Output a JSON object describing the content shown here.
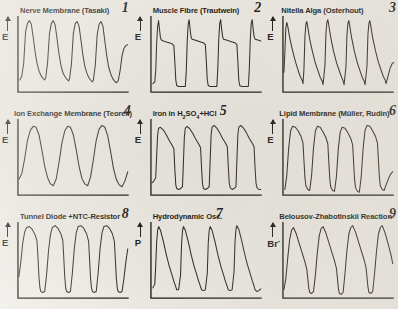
{
  "figure": {
    "background_color": "#f1eee8",
    "ink_color": "#15130f",
    "rows": 3,
    "columns": 3
  },
  "panels": [
    {
      "number": "1",
      "title": "Nerve Membrane (Tasaki)",
      "y_axis_label": "E",
      "waveform": "spike-train-fast-rise-slow-decay"
    },
    {
      "number": "2",
      "title": "Muscle Fibre (Trautwein)",
      "y_axis_label": "E",
      "waveform": "plateau-action-potential"
    },
    {
      "number": "3",
      "title": "Nitella Alga (Osterhout)",
      "y_axis_label": "E",
      "waveform": "spike-train-sawtooth-decay"
    },
    {
      "number": "4",
      "title": "Ion Exchange Membrane (Teorell)",
      "y_axis_label": "E",
      "waveform": "smooth-rounded-sinusoidal"
    },
    {
      "number": "5",
      "title_prefix": "Iron in H",
      "title_sub1": "2",
      "title_mid": "SO",
      "title_sub2": "4",
      "title_suffix": "+HCl",
      "title": "Iron in H2SO4+HCl",
      "y_axis_label": "E",
      "waveform": "square-relaxation-slow-decay"
    },
    {
      "number": "6",
      "title": "Lipid Membrane (Müller, Rudin)",
      "y_axis_label": "E",
      "waveform": "sharp-rise-concave-decay"
    },
    {
      "number": "8",
      "title": "Tunnel Diode +NTC-Resistor",
      "y_axis_label": "E",
      "waveform": "relaxation-slow-rise-vertical-drop"
    },
    {
      "number": "7",
      "title": "Hydrodynamic Osc.",
      "y_axis_label": "P",
      "waveform": "spike-train-fast-rise-slow-decay"
    },
    {
      "number": "9",
      "title": "Belousov-Zhabotinskii Reaction",
      "y_axis_label": "Br",
      "y_axis_sup": "-",
      "waveform": "bz-sawtooth-linear-decay"
    }
  ]
}
